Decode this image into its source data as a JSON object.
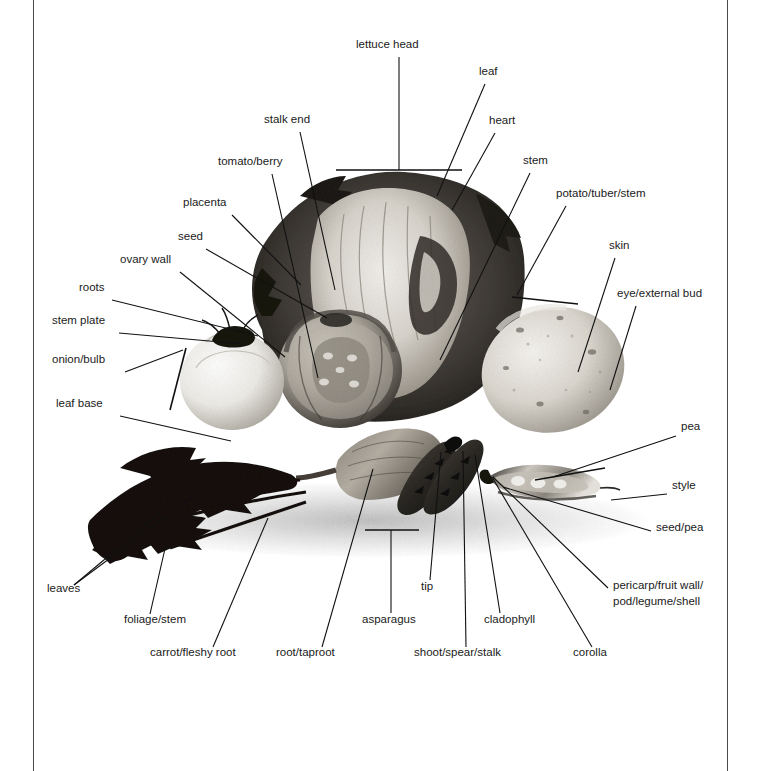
{
  "figure": {
    "kind": "labelled-photograph",
    "background_color": "#ffffff",
    "line_color": "#111111",
    "text_color": "#1a1a1a",
    "page_rule_color": "#4a4a4a"
  },
  "labels": [
    {
      "id": "lettuce-head",
      "text": "lettuce head",
      "x": 356,
      "y": 48,
      "anchor": "start"
    },
    {
      "id": "leaf",
      "text": "leaf",
      "x": 479,
      "y": 75,
      "anchor": "start"
    },
    {
      "id": "heart",
      "text": "heart",
      "x": 489,
      "y": 124,
      "anchor": "start"
    },
    {
      "id": "stem",
      "text": "stem",
      "x": 523,
      "y": 164,
      "anchor": "start"
    },
    {
      "id": "stalk-end",
      "text": "stalk end",
      "x": 264,
      "y": 123,
      "anchor": "start"
    },
    {
      "id": "tomato-berry",
      "text": "tomato/berry",
      "x": 218,
      "y": 165,
      "anchor": "start"
    },
    {
      "id": "placenta",
      "text": "placenta",
      "x": 183,
      "y": 206,
      "anchor": "start"
    },
    {
      "id": "seed",
      "text": "seed",
      "x": 178,
      "y": 240,
      "anchor": "start"
    },
    {
      "id": "ovary-wall",
      "text": "ovary wall",
      "x": 120,
      "y": 263,
      "anchor": "start"
    },
    {
      "id": "roots",
      "text": "roots",
      "x": 79,
      "y": 291,
      "anchor": "start"
    },
    {
      "id": "stem-plate",
      "text": "stem plate",
      "x": 52,
      "y": 324,
      "anchor": "start"
    },
    {
      "id": "onion-bulb",
      "text": "onion/bulb",
      "x": 52,
      "y": 363,
      "anchor": "start"
    },
    {
      "id": "leaf-base",
      "text": "leaf base",
      "x": 56,
      "y": 407,
      "anchor": "start"
    },
    {
      "id": "potato-tuber",
      "text": "potato/tuber/stem",
      "x": 556,
      "y": 197,
      "anchor": "start"
    },
    {
      "id": "skin",
      "text": "skin",
      "x": 609,
      "y": 249,
      "anchor": "start"
    },
    {
      "id": "eye-external",
      "text": "eye/external bud",
      "x": 617,
      "y": 297,
      "anchor": "start"
    },
    {
      "id": "pea",
      "text": "pea",
      "x": 681,
      "y": 430,
      "anchor": "start"
    },
    {
      "id": "style",
      "text": "style",
      "x": 672,
      "y": 489,
      "anchor": "start"
    },
    {
      "id": "seed-pea",
      "text": "seed/pea",
      "x": 656,
      "y": 531,
      "anchor": "start"
    },
    {
      "id": "pericarp-1",
      "text": "pericarp/fruit wall/",
      "x": 613,
      "y": 589,
      "anchor": "start"
    },
    {
      "id": "pericarp-2",
      "text": "pod/legume/shell",
      "x": 613,
      "y": 605,
      "anchor": "start"
    },
    {
      "id": "leaves",
      "text": "leaves",
      "x": 47,
      "y": 592,
      "anchor": "start"
    },
    {
      "id": "foliage-stem",
      "text": "foliage/stem",
      "x": 124,
      "y": 623,
      "anchor": "start"
    },
    {
      "id": "carrot-root",
      "text": "carrot/fleshy root",
      "x": 150,
      "y": 656,
      "anchor": "start"
    },
    {
      "id": "root-taproot",
      "text": "root/taproot",
      "x": 276,
      "y": 656,
      "anchor": "start"
    },
    {
      "id": "asparagus",
      "text": "asparagus",
      "x": 362,
      "y": 623,
      "anchor": "start"
    },
    {
      "id": "tip",
      "text": "tip",
      "x": 421,
      "y": 590,
      "anchor": "start"
    },
    {
      "id": "shoot-spear",
      "text": "shoot/spear/stalk",
      "x": 414,
      "y": 656,
      "anchor": "start"
    },
    {
      "id": "cladophyll",
      "text": "cladophyll",
      "x": 484,
      "y": 623,
      "anchor": "start"
    },
    {
      "id": "corolla",
      "text": "corolla",
      "x": 573,
      "y": 656,
      "anchor": "start"
    }
  ],
  "leader_lines": [
    {
      "id": "lettuce-head-stem",
      "points": "399,57 399,170"
    },
    {
      "id": "lettuce-head-bar",
      "points": "336,170 462,170",
      "bracket": true
    },
    {
      "id": "leaf-line",
      "points": "485,84 437,196"
    },
    {
      "id": "heart-line",
      "points": "495,133 452,210"
    },
    {
      "id": "stem-line",
      "points": "530,173 440,360"
    },
    {
      "id": "stalk-end-line",
      "points": "300,132 335,290"
    },
    {
      "id": "tomato-berry-line",
      "points": "272,174 318,378"
    },
    {
      "id": "placenta-line",
      "points": "232,215 301,285"
    },
    {
      "id": "seed-line",
      "points": "206,249 327,318"
    },
    {
      "id": "ovary-wall-line",
      "points": "180,272 285,357"
    },
    {
      "id": "roots-line",
      "points": "112,300 258,336"
    },
    {
      "id": "stem-plate-line",
      "points": "119,333 243,344"
    },
    {
      "id": "onion-bulb-line",
      "points": "125,372 183,350"
    },
    {
      "id": "onion-bracket",
      "points": "186,348 170,410",
      "bracket": true
    },
    {
      "id": "leaf-base-line",
      "points": "120,416 231,441"
    },
    {
      "id": "potato-tuber-line",
      "points": "566,206 517,295"
    },
    {
      "id": "potato-bracket",
      "points": "512,297 578,304",
      "bracket": true
    },
    {
      "id": "skin-line",
      "points": "615,258 578,372"
    },
    {
      "id": "eye-external-line",
      "points": "636,306 610,390"
    },
    {
      "id": "pea-line",
      "points": "676,436 553,477"
    },
    {
      "id": "pea-bracket",
      "points": "535,480 605,468",
      "bracket": true
    },
    {
      "id": "style-line",
      "points": "667,494 611,500"
    },
    {
      "id": "seed-pea-line",
      "points": "651,531 503,487"
    },
    {
      "id": "pericarp-line",
      "points": "608,588 493,477"
    },
    {
      "id": "leaves-line-a",
      "points": "74,585 160,513"
    },
    {
      "id": "leaves-line-b",
      "points": "74,585 195,495"
    },
    {
      "id": "foliage-stem-line",
      "points": "150,614 167,540"
    },
    {
      "id": "carrot-root-line",
      "points": "213,647 268,518"
    },
    {
      "id": "root-taproot-line",
      "points": "322,647 373,469"
    },
    {
      "id": "asparagus-line",
      "points": "391,613 391,530"
    },
    {
      "id": "asparagus-bracket",
      "points": "365,530 419,530",
      "bracket": true
    },
    {
      "id": "tip-line",
      "points": "430,580 441,452"
    },
    {
      "id": "shoot-spear-line",
      "points": "466,647 463,451"
    },
    {
      "id": "cladophyll-line",
      "points": "500,613 475,455"
    },
    {
      "id": "corolla-line",
      "points": "592,647 492,477"
    }
  ],
  "photograph": {
    "alt": "Black and white photograph of cut vegetables arranged together",
    "region": {
      "x": 60,
      "y": 175,
      "width": 620,
      "height": 350
    }
  }
}
